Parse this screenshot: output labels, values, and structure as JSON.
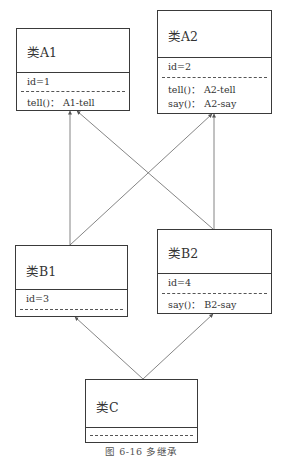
{
  "classes": {
    "A1": {
      "name": "类A1",
      "attributes": [
        "id=1"
      ],
      "methods": [
        "tell()：  A1-tell"
      ]
    },
    "A2": {
      "name": "类A2",
      "attributes": [
        "id=2"
      ],
      "methods": [
        "tell()：  A2-tell",
        "say()：  A2-say"
      ]
    },
    "B1": {
      "name": "类B1",
      "attributes": [
        "id=3"
      ],
      "methods": []
    },
    "B2": {
      "name": "类B2",
      "attributes": [
        "id=4"
      ],
      "methods": [
        "say()：  B2-say"
      ]
    },
    "C": {
      "name": "类C",
      "attributes": [],
      "methods": []
    }
  },
  "inheritance": [
    {
      "from": "B1",
      "to": "A1"
    },
    {
      "from": "B1",
      "to": "A2"
    },
    {
      "from": "B2",
      "to": "A1"
    },
    {
      "from": "B2",
      "to": "A2"
    },
    {
      "from": "C",
      "to": "B1"
    },
    {
      "from": "C",
      "to": "B2"
    }
  ],
  "caption": "图 6-16    多继承"
}
